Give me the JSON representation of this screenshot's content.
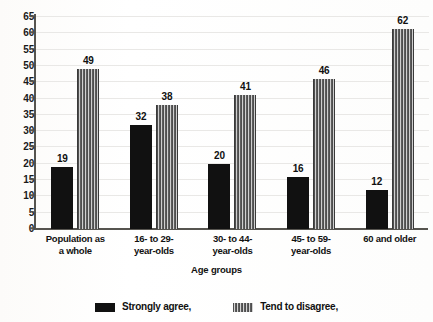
{
  "chart_data": {
    "type": "bar",
    "title": "",
    "subtitle": "",
    "xlabel": "Age groups",
    "ylabel": "",
    "ylim": [
      0,
      65
    ],
    "ytick_step": 5,
    "yticks": [
      "65",
      "60",
      "55",
      "50",
      "45",
      "40",
      "35",
      "30",
      "25",
      "20",
      "15",
      "10",
      "5",
      "0"
    ],
    "grid": true,
    "legend_position": "bottom",
    "categories": [
      "Population as\na whole",
      "16- to 29-\nyear-olds",
      "30- to 44-\nyear-olds",
      "45- to 59-\nyear-olds",
      "60 and older"
    ],
    "series": [
      {
        "name": "Strongly agree,",
        "pattern": "solid",
        "color": "#111111",
        "values": [
          19,
          32,
          20,
          16,
          12
        ]
      },
      {
        "name": "Tend to disagree,",
        "pattern": "vertical-stripes",
        "color": "#5a5a5a",
        "values": [
          49,
          38,
          41,
          46,
          62
        ]
      }
    ]
  },
  "legend": {
    "items": [
      {
        "label": "Strongly agree,",
        "swatch": "solid-black-swatch"
      },
      {
        "label": "Tend to disagree,",
        "swatch": "striped-gray-swatch"
      }
    ]
  },
  "colors": {
    "series_solid": "#111111",
    "series_striped": "#5a5a5a",
    "axis": "#56544f",
    "gridline": "#e9e8e6",
    "background": "#fdfdfc",
    "text": "#111111"
  }
}
